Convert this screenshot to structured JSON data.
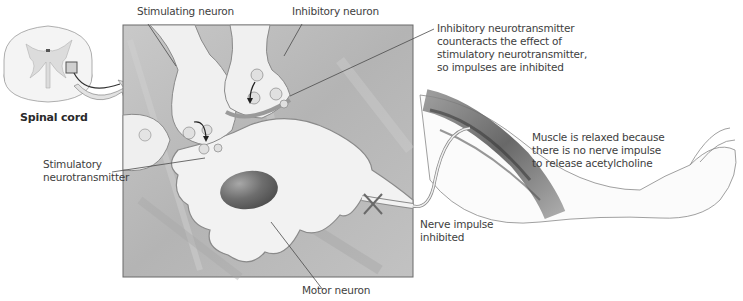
{
  "figure": {
    "type": "anatomical-diagram",
    "color_mode": "grayscale",
    "colors": {
      "panel_bg": "#b8b8b8",
      "panel_border": "#6a6a6a",
      "neuron_fill": "#f2f2f2",
      "neuron_outline": "#8a8a8a",
      "nucleus": "#6e6e6e",
      "text": "#3e3e3e",
      "leader_line": "#4a4a4a"
    }
  },
  "labels": {
    "spinal_cord": "Spinal cord",
    "stimulating_neuron": "Stimulating neuron",
    "inhibitory_neuron": "Inhibitory neuron",
    "inhibitory_neurotransmitter": [
      "Inhibitory neurotransmitter",
      "counteracts the effect of",
      "stimulatory neurotransmitter,",
      "so impulses are inhibited"
    ],
    "stimulatory_neurotransmitter": [
      "Stimulatory",
      "neurotransmitter"
    ],
    "nerve_impulse": [
      "Nerve impulse",
      "inhibited"
    ],
    "muscle_relaxed": [
      "Muscle is relaxed because",
      "there is no nerve impulse",
      "to release acetylcholine"
    ],
    "motor_neuron": "Motor neuron"
  },
  "markers": {
    "blocked_signal": "X"
  }
}
